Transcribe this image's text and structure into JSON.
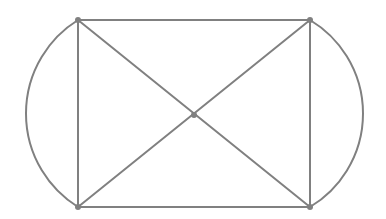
{
  "figure": {
    "title": "Graph diagram",
    "background_color": "#ffffff",
    "width": 386,
    "height": 219
  },
  "style": {
    "edge_color": "#808080",
    "edge_width": 2,
    "arc_color": "#808080",
    "arc_width": 2,
    "vertex_color": "#808080",
    "vertex_radius": 3
  },
  "chart_data": {
    "type": "diagram",
    "title": "Graph diagram",
    "xlabel": "",
    "ylabel": "",
    "grid": false,
    "legend": false,
    "xlim": [
      0,
      386
    ],
    "ylim": [
      0,
      219
    ],
    "node_count": 5,
    "edge_count": 8,
    "nodes": [
      {
        "id": "tl",
        "label": "top-left",
        "x": 78,
        "y": 20
      },
      {
        "id": "tr",
        "label": "top-right",
        "x": 310,
        "y": 20
      },
      {
        "id": "bl",
        "label": "bottom-left",
        "x": 78,
        "y": 207
      },
      {
        "id": "br",
        "label": "bottom-right",
        "x": 310,
        "y": 207
      },
      {
        "id": "c",
        "label": "center",
        "x": 194,
        "y": 115
      }
    ],
    "edges": [
      {
        "id": "edge-top",
        "from": "tl",
        "to": "tr",
        "shape": "line"
      },
      {
        "id": "edge-bottom",
        "from": "bl",
        "to": "br",
        "shape": "line"
      },
      {
        "id": "edge-left-side",
        "from": "tl",
        "to": "bl",
        "shape": "line"
      },
      {
        "id": "edge-right-side",
        "from": "tr",
        "to": "br",
        "shape": "line"
      },
      {
        "id": "edge-diagonal-tl-br",
        "from": "tl",
        "to": "br",
        "shape": "line",
        "via": "c"
      },
      {
        "id": "edge-diagonal-tr-bl",
        "from": "tr",
        "to": "bl",
        "shape": "line",
        "via": "c"
      },
      {
        "id": "edge-arc-left",
        "from": "tl",
        "to": "bl",
        "shape": "arc",
        "bulge_x": 26,
        "direction": "left"
      },
      {
        "id": "edge-arc-right",
        "from": "tr",
        "to": "br",
        "shape": "arc",
        "bulge_x": 363,
        "direction": "right"
      }
    ]
  }
}
